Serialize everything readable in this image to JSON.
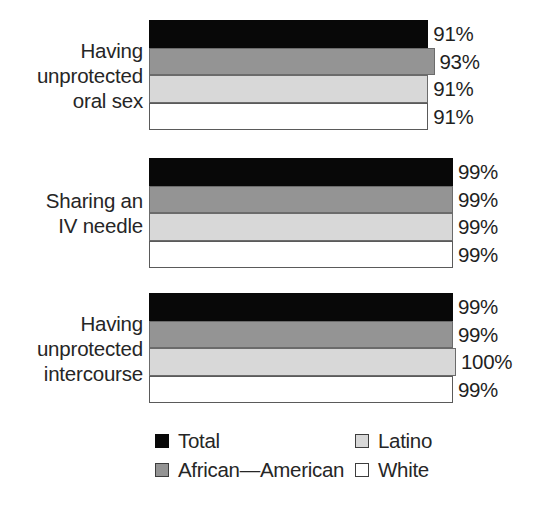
{
  "chart_data": {
    "type": "bar",
    "orientation": "horizontal",
    "title": "",
    "subtitle": "",
    "xlabel": "",
    "ylabel": "",
    "grid": false,
    "xlim": [
      0,
      100
    ],
    "value_suffix": "%",
    "legend_position": "bottom",
    "categories": [
      "Having unprotected oral sex",
      "Sharing an IV needle",
      "Having unprotected intercourse"
    ],
    "series": [
      {
        "name": "Total",
        "color": "#080808",
        "values": [
          91,
          99,
          99
        ]
      },
      {
        "name": "African—American",
        "color": "#949494",
        "values": [
          93,
          99,
          99
        ]
      },
      {
        "name": "Latino",
        "color": "#d8d8d8",
        "values": [
          91,
          99,
          100
        ]
      },
      {
        "name": "White",
        "color": "#ffffff",
        "values": [
          91,
          99,
          99
        ]
      }
    ]
  },
  "groups": [
    {
      "label_lines": [
        "Having",
        "unprotected",
        "oral sex"
      ],
      "bars": [
        {
          "series": "Total",
          "swatch": "s-total",
          "value": 91,
          "value_label": "91%"
        },
        {
          "series": "African—American",
          "swatch": "s-aa",
          "value": 93,
          "value_label": "93%"
        },
        {
          "series": "Latino",
          "swatch": "s-latino",
          "value": 91,
          "value_label": "91%"
        },
        {
          "series": "White",
          "swatch": "s-white",
          "value": 91,
          "value_label": "91%"
        }
      ]
    },
    {
      "label_lines": [
        "Sharing an",
        "IV needle"
      ],
      "bars": [
        {
          "series": "Total",
          "swatch": "s-total",
          "value": 99,
          "value_label": "99%"
        },
        {
          "series": "African—American",
          "swatch": "s-aa",
          "value": 99,
          "value_label": "99%"
        },
        {
          "series": "Latino",
          "swatch": "s-latino",
          "value": 99,
          "value_label": "99%"
        },
        {
          "series": "White",
          "swatch": "s-white",
          "value": 99,
          "value_label": "99%"
        }
      ]
    },
    {
      "label_lines": [
        "Having",
        "unprotected",
        "intercourse"
      ],
      "bars": [
        {
          "series": "Total",
          "swatch": "s-total",
          "value": 99,
          "value_label": "99%"
        },
        {
          "series": "African—American",
          "swatch": "s-aa",
          "value": 99,
          "value_label": "99%"
        },
        {
          "series": "Latino",
          "swatch": "s-latino",
          "value": 100,
          "value_label": "100%"
        },
        {
          "series": "White",
          "swatch": "s-white",
          "value": 99,
          "value_label": "99%"
        }
      ]
    }
  ],
  "legend": {
    "items": [
      {
        "label": "Total",
        "swatch": "s-total",
        "color": "#080808",
        "col": 0,
        "row": 0
      },
      {
        "label": "African—American",
        "swatch": "s-aa",
        "color": "#949494",
        "col": 0,
        "row": 1
      },
      {
        "label": "Latino",
        "swatch": "s-latino",
        "color": "#d8d8d8",
        "col": 1,
        "row": 0
      },
      {
        "label": "White",
        "swatch": "s-white",
        "color": "#ffffff",
        "col": 1,
        "row": 1
      }
    ]
  },
  "layout": {
    "bar_left_px": 149,
    "bar_height_px": 27.5,
    "group_tops_px": [
      20,
      158,
      293
    ],
    "px_per_unit": 3.07,
    "legend_col_x_px": [
      155,
      355
    ],
    "legend_row_y_px": [
      0,
      29
    ]
  }
}
